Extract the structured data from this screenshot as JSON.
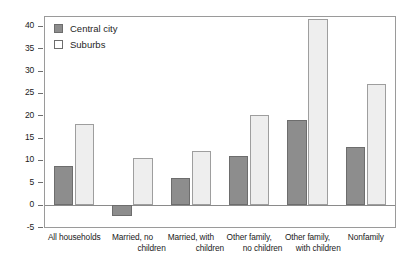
{
  "chart_data": {
    "type": "bar",
    "title": "",
    "xlabel": "",
    "ylabel": "",
    "ylim": [
      -5,
      42
    ],
    "yticks": [
      -5,
      0,
      5,
      10,
      15,
      20,
      25,
      30,
      35,
      40
    ],
    "grid": false,
    "legend_position": "top-left-inside",
    "categories": [
      "All households",
      "Married, no children",
      "Married, with children",
      "Other family, no children",
      "Other family, with children",
      "Nonfamily"
    ],
    "category_lines": [
      [
        "All households",
        ""
      ],
      [
        "Married, no",
        "children"
      ],
      [
        "Married, with",
        "children"
      ],
      [
        "Other family,",
        "no children"
      ],
      [
        "Other family,",
        "with children"
      ],
      [
        "Nonfamily",
        ""
      ]
    ],
    "series": [
      {
        "name": "Central city",
        "color": "#8d8d8d",
        "values": [
          8.7,
          -2.5,
          6.0,
          11.0,
          19.0,
          13.0
        ]
      },
      {
        "name": "Suburbs",
        "color": "#eeeeee",
        "values": [
          18.0,
          10.5,
          12.0,
          20.0,
          41.5,
          27.0
        ]
      }
    ]
  },
  "legend": {
    "items": [
      {
        "label": "Central city",
        "swatch": "filled-gray-square"
      },
      {
        "label": "Suburbs",
        "swatch": "empty-white-square"
      }
    ]
  },
  "axis": {
    "y_labels": [
      "40",
      "35",
      "30",
      "25",
      "20",
      "15",
      "10",
      "5",
      "0",
      "-5"
    ]
  }
}
